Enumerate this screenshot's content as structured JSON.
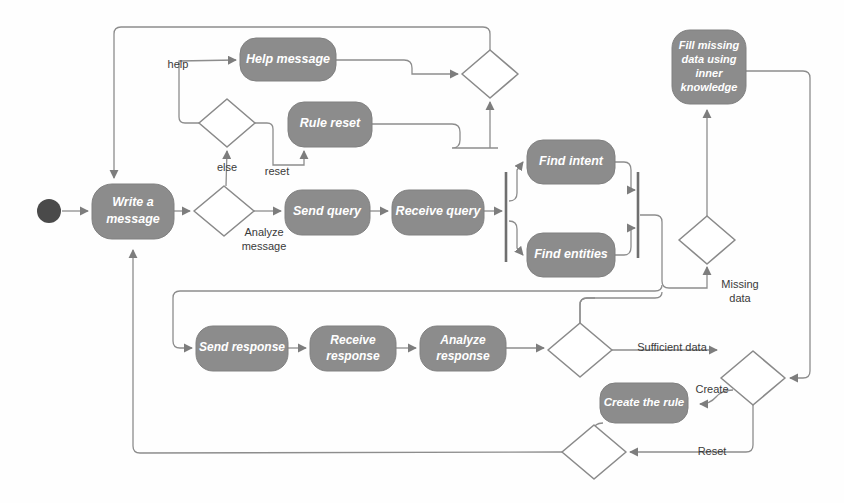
{
  "diagram": {
    "type": "uml-activity-diagram",
    "background": "#fefefe",
    "activity_fill": "#8c8c8c",
    "activity_stroke": "#7a7a7a",
    "node_stroke": "#8a8a8a",
    "edge_color": "#8d8d8d",
    "label_color": "#3a3a3a",
    "activity_text_color": "#ffffff",
    "initial_node_color": "#4a4a4a"
  },
  "nodes": {
    "initial": {
      "name": "initial-node",
      "cx": 49,
      "cy": 211,
      "r": 12
    },
    "write_a_message": {
      "label": "Write a\nmessage",
      "line1": "Write a",
      "line2": "message",
      "x": 92,
      "y": 184,
      "w": 82,
      "h": 55
    },
    "help_message": {
      "label": "Help message",
      "x": 240,
      "y": 38,
      "w": 96,
      "h": 43
    },
    "rule_reset": {
      "label": "Rule reset",
      "x": 288,
      "y": 102,
      "w": 84,
      "h": 45
    },
    "send_query": {
      "label": "Send query",
      "x": 285,
      "y": 190,
      "w": 85,
      "h": 45
    },
    "receive_query": {
      "label": "Receive query",
      "x": 392,
      "y": 190,
      "w": 92,
      "h": 45
    },
    "find_intent": {
      "label": "Find intent",
      "x": 527,
      "y": 140,
      "w": 88,
      "h": 44
    },
    "find_entities": {
      "label": "Find entities",
      "x": 527,
      "y": 233,
      "w": 88,
      "h": 44
    },
    "fill_missing": {
      "label": "Fill missing data using inner knowledge",
      "line1": "Fill missing",
      "line2": "data using",
      "line3": "inner",
      "line4": "knowledge",
      "x": 672,
      "y": 30,
      "w": 74,
      "h": 74
    },
    "send_response": {
      "label": "Send response",
      "x": 196,
      "y": 326,
      "w": 92,
      "h": 45
    },
    "receive_response": {
      "label": "Receive\nresponse",
      "line1": "Receive",
      "line2": "response",
      "x": 310,
      "y": 326,
      "w": 86,
      "h": 45
    },
    "analyze_response": {
      "label": "Analyze\nresponse",
      "line1": "Analyze",
      "line2": "response",
      "x": 420,
      "y": 326,
      "w": 86,
      "h": 45
    },
    "create_the_rule": {
      "label": "Create the rule",
      "x": 600,
      "y": 383,
      "w": 88,
      "h": 40
    }
  },
  "decisions": {
    "branch_help_reset": {
      "name": "help-reset-branch",
      "cx": 227,
      "cy": 123,
      "rx": 28,
      "ry": 24
    },
    "merge_top_right": {
      "name": "top-right-merge",
      "cx": 490,
      "cy": 74,
      "rx": 28,
      "ry": 24
    },
    "analyze_message": {
      "name": "analyze-message-decision",
      "cx": 224,
      "cy": 211,
      "rx": 30,
      "ry": 25
    },
    "missing_data": {
      "name": "missing-data-decision",
      "cx": 707,
      "cy": 240,
      "rx": 28,
      "ry": 24
    },
    "sufficient_data": {
      "name": "sufficient-data-decision",
      "cx": 580,
      "cy": 350,
      "rx": 32,
      "ry": 27
    },
    "create_reset": {
      "name": "create-reset-decision",
      "cx": 753,
      "cy": 378,
      "rx": 32,
      "ry": 27
    },
    "bottom_merge": {
      "name": "bottom-merge",
      "cx": 594,
      "cy": 452,
      "rx": 32,
      "ry": 27
    }
  },
  "bars": {
    "fork": {
      "name": "fork-bar",
      "x": 506,
      "y1": 172,
      "y2": 262
    },
    "join": {
      "name": "join-bar",
      "x": 638,
      "y1": 172,
      "y2": 258
    }
  },
  "guards": {
    "help": {
      "text": "help",
      "x": 178,
      "y": 65
    },
    "else": {
      "text": "else",
      "x": 227,
      "y": 168
    },
    "reset": {
      "text": "reset",
      "x": 277,
      "y": 172
    },
    "analyze_message_l1": {
      "text": "Analyze",
      "x": 264,
      "y": 233
    },
    "analyze_message_l2": {
      "text": "message",
      "x": 264,
      "y": 246
    },
    "missing_data_l1": {
      "text": "Missing",
      "x": 738,
      "y": 285
    },
    "missing_data_l2": {
      "text": "data",
      "x": 738,
      "y": 298
    },
    "sufficient_data": {
      "text": "Sufficient data",
      "x": 670,
      "y": 348
    },
    "create": {
      "text": "Create",
      "x": 712,
      "y": 390
    },
    "reset_bottom": {
      "text": "Reset",
      "x": 712,
      "y": 452
    }
  }
}
